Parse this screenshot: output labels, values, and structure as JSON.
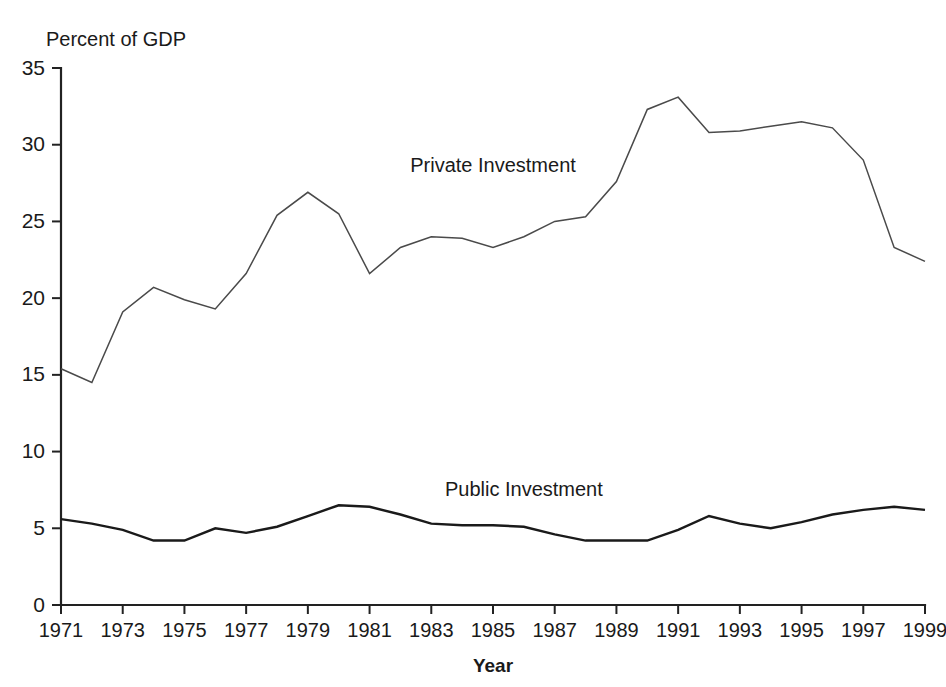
{
  "chart_data": {
    "type": "line",
    "title": "",
    "subtitle": "",
    "ylabel": "Percent of GDP",
    "xlabel": "Year",
    "ylim": [
      0,
      35
    ],
    "xlim": [
      1971,
      1999
    ],
    "yticks": [
      0,
      5,
      10,
      15,
      20,
      25,
      30,
      35
    ],
    "ytick_labels": [
      "0",
      "5",
      "10",
      "15",
      "20",
      "25",
      "30",
      "35"
    ],
    "xticks": [
      1971,
      1973,
      1975,
      1977,
      1979,
      1981,
      1983,
      1985,
      1987,
      1989,
      1991,
      1993,
      1995,
      1997,
      1999
    ],
    "xtick_labels": [
      "1971",
      "1973",
      "1975",
      "1977",
      "1979",
      "1981",
      "1983",
      "1985",
      "1987",
      "1989",
      "1991",
      "1993",
      "1995",
      "1997",
      "1999"
    ],
    "grid": false,
    "legend_position": "inline-annotations",
    "x": [
      1971,
      1972,
      1973,
      1974,
      1975,
      1976,
      1977,
      1978,
      1979,
      1980,
      1981,
      1982,
      1983,
      1984,
      1985,
      1986,
      1987,
      1988,
      1989,
      1990,
      1991,
      1992,
      1993,
      1994,
      1995,
      1996,
      1997,
      1998,
      1999
    ],
    "series": [
      {
        "name": "Private Investment",
        "color": "#4a4a4a",
        "label_x": 1985,
        "label_y": 28.2,
        "values": [
          15.4,
          14.5,
          19.1,
          20.7,
          19.9,
          19.3,
          21.6,
          25.4,
          26.9,
          25.5,
          21.6,
          23.3,
          24.0,
          23.9,
          23.3,
          24.0,
          25.0,
          25.3,
          27.6,
          32.3,
          33.1,
          30.8,
          30.9,
          31.2,
          31.5,
          31.1,
          29.0,
          23.3,
          22.4
        ]
      },
      {
        "name": "Public Investment",
        "color": "#1a1a1a",
        "label_x": 1986,
        "label_y": 7.1,
        "values": [
          5.6,
          5.3,
          4.9,
          4.2,
          4.2,
          5.0,
          4.7,
          5.1,
          5.8,
          6.5,
          6.4,
          5.9,
          5.3,
          5.2,
          5.2,
          5.1,
          4.6,
          4.2,
          4.2,
          4.2,
          4.9,
          5.8,
          5.3,
          5.0,
          5.4,
          5.9,
          6.2,
          6.4,
          6.2
        ]
      }
    ],
    "annotations": [
      {
        "text": "Private Investment",
        "name": "private-investment-label"
      },
      {
        "text": "Public Investment",
        "name": "public-investment-label"
      }
    ]
  }
}
